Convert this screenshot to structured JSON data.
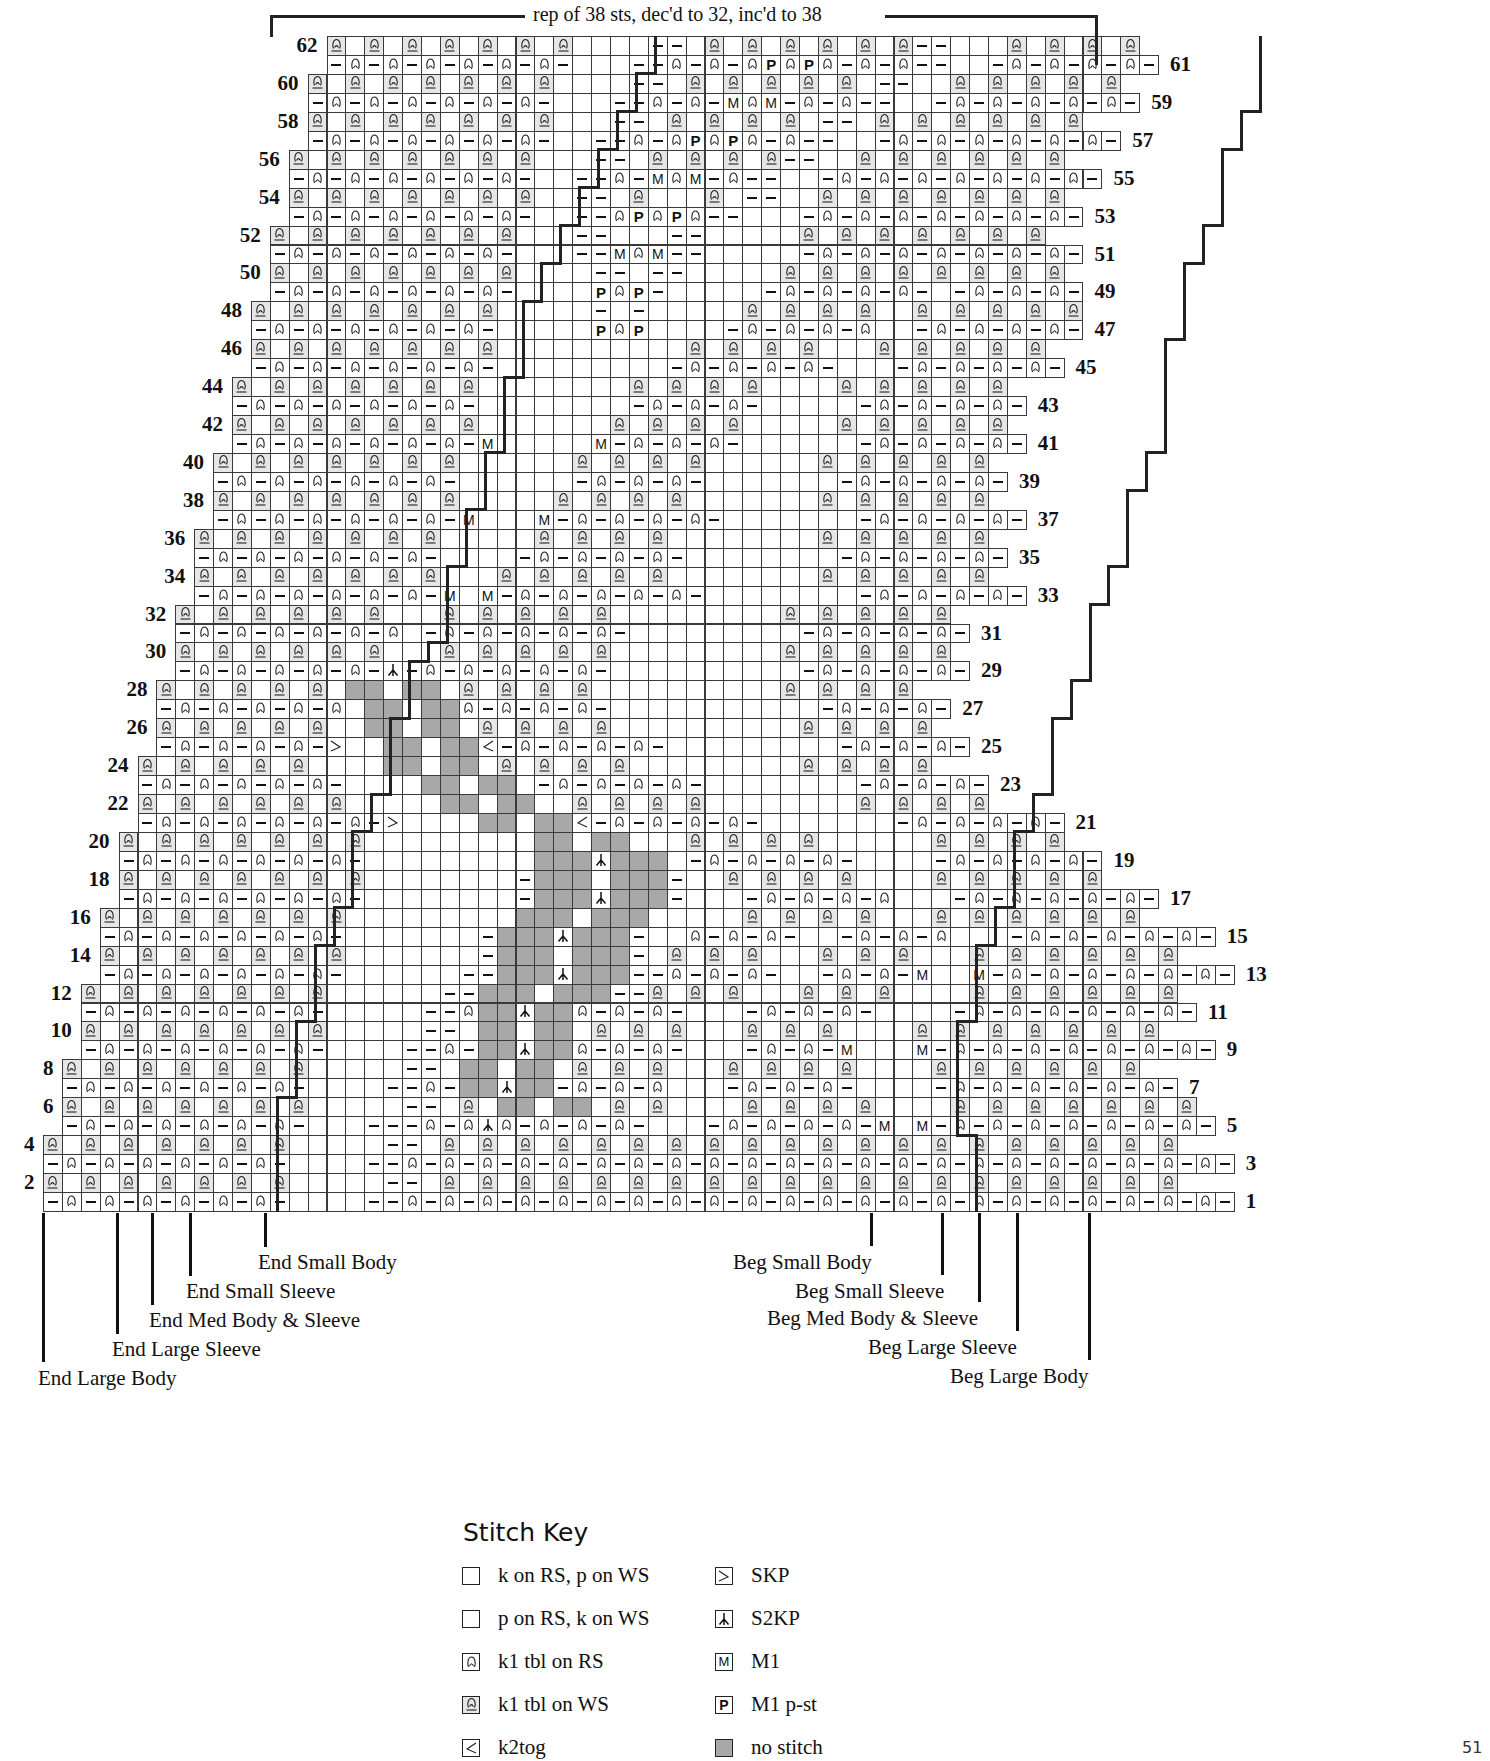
{
  "caption": "rep of 38 sts, dec'd to 32, inc'd to 38",
  "page_number": "51",
  "grid": {
    "cell_w": 18.9,
    "cell_h": 18.95,
    "row1_top": 1192,
    "row1_left": 43,
    "note": "legend: . knit, - purl, q k1 tbl on RS, Q k1 tbl on WS, / k2tog, \\ SKP, ^ S2KP, M M1, P M1 p-st, # no stitch",
    "rows": [
      {
        "n": 1,
        "start": 0,
        "cells": "-q-q-q-q-q-q-....--q-q-q-q-q-q-q-q-q-q-q-q-q-q-q-q-q-q-q-q-q-q-"
      },
      {
        "n": 2,
        "start": 0,
        "cells": "Q.Q.Q.Q.Q.Q.Q.....--.Q.Q.Q.Q.Q.Q.Q.Q.Q.Q.Q.Q.Q.Q.Q.Q.Q.Q.Q.Q"
      },
      {
        "n": 3,
        "start": 0,
        "cells": "-q-q-q-q-q-q-....--q-q-q-q-q-q-q-q-q-q-q-q-q-q-q-q-q-q-q-q-q-q-"
      },
      {
        "n": 4,
        "start": 0,
        "cells": "Q.Q.Q.Q.Q.Q.Q.....--.Q.Q.Q.Q.Q.Q.Q.Q.Q.Q.Q.Q.Q.Q.Q.Q.Q.Q.Q.Q"
      },
      {
        "n": 5,
        "start": 1,
        "cells": "-q-q-q-q-q-q-...---q-q^q-q-q-q-...-q-q-q-q-M.M-q-q-q-q-q-q-q-"
      },
      {
        "n": 6,
        "start": 1,
        "cells": "Q.Q.Q.Q.Q.Q.Q.....--.Q.##.##.Q.Q....Q.Q.Q.Q....Q.Q.Q.Q.Q.Q.Q"
      },
      {
        "n": 7,
        "start": 1,
        "cells": "-q-q-q-q-q-q-....--q-##^##-q-q-q...-q-q-q-....-q-q-q-q-q-q-"
      },
      {
        "n": 8,
        "start": 1,
        "cells": "Q.Q.Q.Q.Q.Q.Q.....--.##.##.Q.Q.Q...Q.Q.Q.Q....Q.Q.Q.Q.Q.Q"
      },
      {
        "n": 9,
        "start": 2,
        "cells": "-q-q-q-q-q-q-....--q-##^##q-q-q-...-q-q-M...M-q-q-q-q-q-q-q-"
      },
      {
        "n": 10,
        "start": 2,
        "cells": "Q.Q.Q.Q.Q.Q.Q.....--.##.##.Q.Q.Q...Q.Q.Q....Q.Q.Q.Q.Q.Q.Q"
      },
      {
        "n": 11,
        "start": 2,
        "cells": "-q-q-q-q-q-q-.....--q##^##q-q-q-...-q-q-q-....-q-q-q-q-q-q-"
      },
      {
        "n": 12,
        "start": 2,
        "cells": "Q.Q.Q.Q.Q.Q.Q......--###.###--Q.Q.Q...Q.Q.Q....Q.Q.Q.Q.Q.Q"
      },
      {
        "n": 13,
        "start": 3,
        "cells": "-q-q-q-q-q-q-......--###^###--q-q-q-..-q-q-M..M-q-q-q-q-q-q-"
      },
      {
        "n": 14,
        "start": 3,
        "cells": "Q.Q.Q.Q.Q.Q.Q.......-###.###-.Q.Q.Q...Q.Q.Q...Q.Q.Q.Q.Q.Q"
      },
      {
        "n": 15,
        "start": 3,
        "cells": "-q-q-q-q-q-q-.......-###^###-..q-q-q-..-q-q-q...-q-q-q-q-q-"
      },
      {
        "n": 16,
        "start": 3,
        "cells": "Q.Q.Q.Q.Q.Q.Q.........###.###.....Q.Q.Q.Q...Q.Q.Q.Q.Q.Q"
      },
      {
        "n": 17,
        "start": 4,
        "cells": "-q-q-q-q-q-q-........-###^###-...-q-q-q-q...-q-q-q-q-q-"
      },
      {
        "n": 18,
        "start": 4,
        "cells": "Q.Q.Q.Q.Q.Q.Q........-###.###-..Q.Q.Q.Q....Q.Q.Q.Q.Q"
      },
      {
        "n": 19,
        "start": 4,
        "cells": "-q-q-q-q-q-q-.........###^###.-q-q-q-q-....-q-q-q-q-"
      },
      {
        "n": 20,
        "start": 4,
        "cells": "Q.Q.Q.Q.Q.Q.Q.........##.##...Q.Q.Q.Q......Q.Q.Q.Q"
      },
      {
        "n": 21,
        "start": 5,
        "cells": "-q-q-q-q-q-q-\\....##.##/-q-q-q-q-.......-q-q-q-q-"
      },
      {
        "n": 22,
        "start": 5,
        "cells": "Q.Q.Q.Q.Q.Q.....##.##..Q.Q.Q.Q........Q.Q.Q.Q"
      },
      {
        "n": 23,
        "start": 5,
        "cells": "-q-q-q-q-q-....##.##.-q-q-q-q-........-q-q-q-"
      },
      {
        "n": 24,
        "start": 5,
        "cells": "Q.Q.Q.Q.Q....##.##.Q.Q.Q.Q.........Q.Q.Q.Q"
      },
      {
        "n": 25,
        "start": 6,
        "cells": "-q-q-q-q-\\..##.##/-q-q-q-q-.........-q-q-q-"
      },
      {
        "n": 26,
        "start": 6,
        "cells": "Q.Q.Q.Q.Q..##.##.Q.Q.Q.Q..........Q.Q.Q.Q"
      },
      {
        "n": 27,
        "start": 6,
        "cells": "-q-q-q-q-q.##.##q-q-q-q-...........-q-q-q-"
      },
      {
        "n": 28,
        "start": 6,
        "cells": "Q.Q.Q.Q.Q.##.##.Q.Q.Q.Q..........Q.Q.Q.Q"
      },
      {
        "n": 29,
        "start": 7,
        "cells": "-q-q-q-q-q-^-q-q-q-q-q-..........-q-q-q-q-"
      },
      {
        "n": 30,
        "start": 7,
        "cells": "Q.Q.Q.Q.Q.Q...Q.Q.Q.Q.Q.........Q.Q.Q.Q.Q"
      },
      {
        "n": 31,
        "start": 7,
        "cells": "-q-q-q-q-q-q.-q-q-q-q-q-.........-q-q-q-q-"
      },
      {
        "n": 32,
        "start": 7,
        "cells": "Q.Q.Q.Q.Q.Q...Q.Q.Q.Q.Q.........Q.Q.Q.Q.Q"
      },
      {
        "n": 33,
        "start": 8,
        "cells": "-q-q-q-q-q-q-M.M-q-q-q-q-q-........-q-q-q-q-"
      },
      {
        "n": 34,
        "start": 8,
        "cells": "Q.Q.Q.Q.Q.Q.Q...Q.Q.Q.Q.Q........Q.Q.Q.Q.Q"
      },
      {
        "n": 35,
        "start": 8,
        "cells": "-q-q-q-q-q-q-....-q-q-q-q-........-q-q-q-q-"
      },
      {
        "n": 36,
        "start": 8,
        "cells": "Q.Q.Q.Q.Q.Q.Q.....Q.Q.Q.Q........Q.Q.Q.Q.Q"
      },
      {
        "n": 37,
        "start": 9,
        "cells": "-q-q-q-q-q-q-M...M-q-q-q-q-.......-q-q-q-q-"
      },
      {
        "n": 38,
        "start": 9,
        "cells": "Q.Q.Q.Q.Q.Q.Q.....Q.Q.Q.Q.......Q.Q.Q.Q.Q"
      },
      {
        "n": 39,
        "start": 9,
        "cells": "-q-q-q-q-q-q-......-q-q-q-.......-q-q-q-q-"
      },
      {
        "n": 40,
        "start": 9,
        "cells": "Q.Q.Q.Q.Q.Q.Q......Q.Q.Q.Q......Q.Q.Q.Q.Q"
      },
      {
        "n": 41,
        "start": 10,
        "cells": "-q-q-q-q-q-q-M.....M-q-q-q-......-q-q-q-q-"
      },
      {
        "n": 42,
        "start": 10,
        "cells": "Q.Q.Q.Q.Q.Q.Q.......Q.Q.Q.Q.....Q.Q.Q.Q.Q"
      },
      {
        "n": 43,
        "start": 10,
        "cells": "-q-q-q-q-q-q-........-q-q-q-.....-q-q-q-q-"
      },
      {
        "n": 44,
        "start": 10,
        "cells": "Q.Q.Q.Q.Q.Q.Q........Q.Q.Q.Q....Q.Q.Q.Q.Q"
      },
      {
        "n": 45,
        "start": 11,
        "cells": "-q-q-q-q-q-q-.........-q-q-q-q-...-q-q-q-q-"
      },
      {
        "n": 46,
        "start": 11,
        "cells": "Q.Q.Q.Q.Q.Q.Q..........Q.Q.Q.Q...Q.Q.Q.Q.Q"
      },
      {
        "n": 47,
        "start": 11,
        "cells": "-q-q-q-q-q-q-.....PqP....-q-q-q-q..-q-q-q-q-"
      },
      {
        "n": 48,
        "start": 11,
        "cells": "Q.Q.Q.Q.Q.Q.Q.....-.-.....Q.Q.Q.Q..Q.Q.Q.Q.Q"
      },
      {
        "n": 49,
        "start": 12,
        "cells": "-q-q-q-q-q-q-....PqP-.....-q-q-q-q-.-q-q-q-"
      },
      {
        "n": 50,
        "start": 12,
        "cells": "Q.Q.Q.Q.Q.Q.Q....--.--.....Q.Q.Q.Q.Q.Q.Q.Q"
      },
      {
        "n": 51,
        "start": 12,
        "cells": "-q-q-q-q-q-q-...--MqM--.....-q-q-q-q-q-q-q-"
      },
      {
        "n": 52,
        "start": 12,
        "cells": "Q.Q.Q.Q.Q.Q.Q...--...--.....Q.Q.Q.Q.Q.Q.Q"
      },
      {
        "n": 53,
        "start": 13,
        "cells": "-q-q-q-q-q-q-..--qPqPq--...-q-q-q-q-q-q-q-"
      },
      {
        "n": 54,
        "start": 13,
        "cells": "Q.Q.Q.Q.Q.Q.Q..--.Q...Q.--..Q.Q.Q.Q.Q.Q.Q"
      },
      {
        "n": 55,
        "start": 13,
        "cells": "-q-q-q-q-q-q-..--q-MqM-q--..-q-q-q-q-q-q-q-"
      },
      {
        "n": 56,
        "start": 13,
        "cells": "Q.Q.Q.Q.Q.Q.Q...--.Q.Q.Q.Q--..Q.Q.Q.Q.Q.Q"
      },
      {
        "n": 57,
        "start": 14,
        "cells": "-q-q-q-q-q-q-..--q-qPqPq-q--..-q-q-q-q-q-q-"
      },
      {
        "n": 58,
        "start": 14,
        "cells": "Q.Q.Q.Q.Q.Q.Q...--.Q.Q.Q.Q.--.Q.Q.Q.Q.Q.Q"
      },
      {
        "n": 59,
        "start": 14,
        "cells": "-q-q-q-q-q-q-...--q-q-MqM-q-q--..-q-q-q-q-q-"
      },
      {
        "n": 60,
        "start": 14,
        "cells": "Q.Q.Q.Q.Q.Q.Q....--.Q.Q.Q.Q.Q.--..Q.Q.Q.Q.Q"
      },
      {
        "n": 61,
        "start": 15,
        "cells": "-q-q-q-q-q-q-...--q-q-qPqPq-q-q--..-q-q-q-q-"
      },
      {
        "n": 62,
        "start": 15,
        "cells": "Q.Q.Q.Q.Q.Q.Q....--.Q.Q.Q.Q.Q.Q--...Q.Q.Q.Q"
      }
    ]
  },
  "row_label_sides": {
    "even": "left",
    "odd": "right"
  },
  "size_markers": {
    "end": [
      {
        "label": "End Small Body",
        "x": 265,
        "line_bottom": 1247,
        "text_x": 258,
        "text_y": 1250
      },
      {
        "label": "End Small Sleeve",
        "x": 190,
        "line_bottom": 1276,
        "text_x": 186,
        "text_y": 1279
      },
      {
        "label": "End Med Body & Sleeve",
        "x": 152,
        "line_bottom": 1305,
        "text_x": 149,
        "text_y": 1308
      },
      {
        "label": "End Large Sleeve",
        "x": 117,
        "line_bottom": 1334,
        "text_x": 112,
        "text_y": 1337
      },
      {
        "label": "End Large Body",
        "x": 43,
        "line_bottom": 1362,
        "text_x": 38,
        "text_y": 1366
      }
    ],
    "beg": [
      {
        "label": "Beg Small Body",
        "x": 871,
        "line_bottom": 1246,
        "text_x": 733,
        "text_y": 1250
      },
      {
        "label": "Beg Small Sleeve",
        "x": 942,
        "line_bottom": 1275,
        "text_x": 795,
        "text_y": 1279
      },
      {
        "label": "Beg Med Body & Sleeve",
        "x": 979,
        "line_bottom": 1302,
        "text_x": 767,
        "text_y": 1306
      },
      {
        "label": "Beg Large Sleeve",
        "x": 1017,
        "line_bottom": 1331,
        "text_x": 868,
        "text_y": 1335
      },
      {
        "label": "Beg Large Body",
        "x": 1089,
        "line_bottom": 1360,
        "text_x": 950,
        "text_y": 1364
      }
    ]
  },
  "stitch_key": {
    "title": "Stitch Key",
    "items": [
      {
        "symbol": "knit",
        "label": "k on RS, p on WS",
        "col": 0,
        "row": 0
      },
      {
        "symbol": "purl",
        "label": "p on RS, k on WS",
        "col": 0,
        "row": 1
      },
      {
        "symbol": "tbl-rs",
        "label": "k1 tbl on RS",
        "col": 0,
        "row": 2
      },
      {
        "symbol": "tbl-ws",
        "label": "k1 tbl on WS",
        "col": 0,
        "row": 3
      },
      {
        "symbol": "k2tog",
        "label": "k2tog",
        "col": 0,
        "row": 4
      },
      {
        "symbol": "skp",
        "label": "SKP",
        "col": 1,
        "row": 0
      },
      {
        "symbol": "s2kp",
        "label": "S2KP",
        "col": 1,
        "row": 1
      },
      {
        "symbol": "m1",
        "label": "M1",
        "col": 1,
        "row": 2
      },
      {
        "symbol": "m1p",
        "label": "M1 p-st",
        "col": 1,
        "row": 3
      },
      {
        "symbol": "no-stitch",
        "label": "no stitch",
        "col": 1,
        "row": 4
      }
    ]
  },
  "colors": {
    "grid_line": "#3a3a3a",
    "tbl_ws_fill": "#e6e6e6",
    "no_stitch_fill": "#a8a8a8",
    "text": "#111111"
  }
}
